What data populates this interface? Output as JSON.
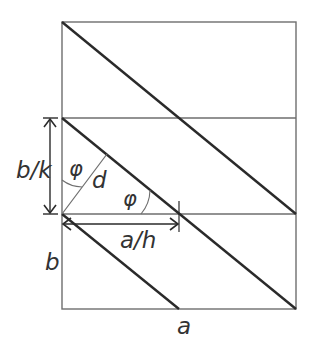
{
  "diagram": {
    "colors": {
      "thin": "#6e6e6e",
      "thick": "#2a2a2a",
      "text": "#333333"
    },
    "rectangle": {
      "x1": 62,
      "y1": 22,
      "x2": 296,
      "y2": 309
    },
    "horizontal_lines": [
      118,
      214
    ],
    "labels": {
      "b_over_k": "b/k",
      "phi_top": "φ",
      "d": "d",
      "phi_right": "φ",
      "a_over_h": "a/h",
      "b": "b",
      "a": "a"
    }
  }
}
